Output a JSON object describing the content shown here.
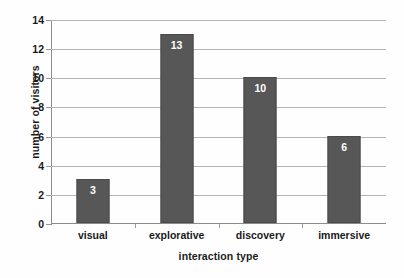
{
  "chart_data": {
    "type": "bar",
    "title": "",
    "subtitle": "",
    "categories": [
      "visual",
      "explorative",
      "discovery",
      "immersive"
    ],
    "values": [
      3,
      13,
      10,
      6
    ],
    "series": [
      {
        "name": "number of visitors",
        "values": [
          3,
          13,
          10,
          6
        ]
      }
    ],
    "data_labels": [
      "3",
      "13",
      "10",
      "6"
    ],
    "xlabel": "interaction type",
    "ylabel": "number of visitors",
    "ylim": [
      0,
      14
    ],
    "ytick_values": [
      0,
      2,
      4,
      6,
      8,
      10,
      12,
      14
    ],
    "ytick_labels": [
      "0",
      "2",
      "4",
      "6",
      "8",
      "10",
      "12",
      "14"
    ],
    "grid": true,
    "grid_axis": "y",
    "legend": false,
    "legend_position": "none",
    "annotations": [],
    "colors": {
      "bar_fill": "#575757",
      "bar_edge": "#4a4a4a",
      "data_label": "#ffffff",
      "gridline": "#b4b4b4",
      "axis_line": "#8c8c8c",
      "tick_mark": "#9a9a9a",
      "text": "#1a1a1a",
      "background": "#fefefe"
    }
  }
}
